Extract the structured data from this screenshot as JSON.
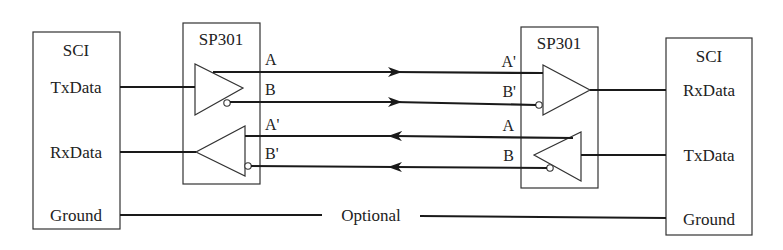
{
  "diagram": {
    "type": "RS-485 differential link between two SCI ports via SP301 transceivers",
    "left_sci": {
      "title": "SCI",
      "pins": [
        "TxData",
        "RxData",
        "Ground"
      ]
    },
    "left_transceiver": {
      "title": "SP301",
      "driver_outputs": [
        "A",
        "B"
      ],
      "receiver_inputs": [
        "A'",
        "B'"
      ]
    },
    "right_transceiver": {
      "title": "SP301",
      "receiver_inputs": [
        "A'",
        "B'"
      ],
      "driver_outputs": [
        "A",
        "B"
      ]
    },
    "right_sci": {
      "title": "SCI",
      "pins": [
        "RxData",
        "TxData",
        "Ground"
      ]
    },
    "ground_link_label": "Optional",
    "colors": {
      "line": "#1a1a1a",
      "box": "#333333",
      "background": "#ffffff"
    }
  }
}
